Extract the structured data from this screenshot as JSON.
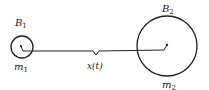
{
  "diagram": {
    "bodies": [
      {
        "name": "B1",
        "label_main": "B",
        "label_sub": "1",
        "mass_main": "m",
        "mass_sub": "1"
      },
      {
        "name": "B2",
        "label_main": "B",
        "label_sub": "2",
        "mass_main": "m",
        "mass_sub": "2"
      }
    ],
    "separation_label": "x(t)",
    "colors": {
      "stroke": "#222222",
      "background": "#ffffff"
    }
  }
}
